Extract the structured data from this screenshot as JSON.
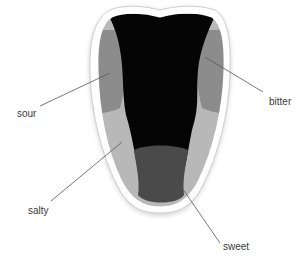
{
  "diagram": {
    "regions": [
      {
        "name": "bitter",
        "color": "#000000"
      },
      {
        "name": "sour",
        "color": "#8a8a8a"
      },
      {
        "name": "salty",
        "color": "#b8b8b8"
      },
      {
        "name": "sweet",
        "color": "#4a4a4a"
      }
    ],
    "labels": {
      "sour": "sour",
      "bitter": "bitter",
      "salty": "salty",
      "sweet": "sweet"
    }
  }
}
